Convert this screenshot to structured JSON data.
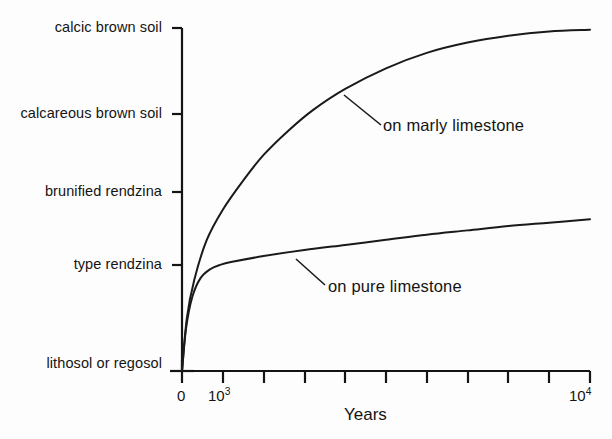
{
  "chart_data": {
    "type": "line",
    "title": "",
    "xlabel": "Years",
    "ylabel": "",
    "grid": false,
    "legend_position": "inline-annotations",
    "xlim": [
      0,
      10000
    ],
    "x_ticks": [
      0,
      1000,
      2000,
      3000,
      4000,
      5000,
      6000,
      7000,
      8000,
      9000,
      10000
    ],
    "x_tick_labels": [
      "0",
      "10^3",
      "",
      "",
      "",
      "",
      "",
      "",
      "",
      "",
      "10^4"
    ],
    "x_tick_label_display": [
      {
        "value": 0,
        "base": "0",
        "exp": ""
      },
      {
        "value": 1000,
        "base": "10",
        "exp": "3"
      },
      {
        "value": 10000,
        "base": "10",
        "exp": "4"
      }
    ],
    "y_categories": [
      "lithosol or regosol",
      "type rendzina",
      "brunified rendzina",
      "calcareous brown soil",
      "calcic brown soil"
    ],
    "y_category_levels": [
      0,
      1,
      2,
      3,
      4
    ],
    "series": [
      {
        "name": "on marly limestone",
        "annotation": "on marly limestone",
        "points": [
          {
            "x": 0,
            "y": 0.0
          },
          {
            "x": 120,
            "y": 0.62
          },
          {
            "x": 300,
            "y": 1.06
          },
          {
            "x": 600,
            "y": 1.52
          },
          {
            "x": 1000,
            "y": 1.88
          },
          {
            "x": 1500,
            "y": 2.22
          },
          {
            "x": 2000,
            "y": 2.52
          },
          {
            "x": 2600,
            "y": 2.8
          },
          {
            "x": 3200,
            "y": 3.04
          },
          {
            "x": 4000,
            "y": 3.29
          },
          {
            "x": 5000,
            "y": 3.53
          },
          {
            "x": 6000,
            "y": 3.71
          },
          {
            "x": 7000,
            "y": 3.83
          },
          {
            "x": 8000,
            "y": 3.91
          },
          {
            "x": 9000,
            "y": 3.96
          },
          {
            "x": 10000,
            "y": 3.98
          }
        ]
      },
      {
        "name": "on pure limestone",
        "annotation": "on pure limestone",
        "points": [
          {
            "x": 0,
            "y": 0.0
          },
          {
            "x": 100,
            "y": 0.5
          },
          {
            "x": 250,
            "y": 0.86
          },
          {
            "x": 450,
            "y": 1.08
          },
          {
            "x": 700,
            "y": 1.19
          },
          {
            "x": 950,
            "y": 1.24
          },
          {
            "x": 1200,
            "y": 1.27
          },
          {
            "x": 2000,
            "y": 1.34
          },
          {
            "x": 3000,
            "y": 1.41
          },
          {
            "x": 4000,
            "y": 1.47
          },
          {
            "x": 5000,
            "y": 1.53
          },
          {
            "x": 6000,
            "y": 1.59
          },
          {
            "x": 7000,
            "y": 1.64
          },
          {
            "x": 8000,
            "y": 1.69
          },
          {
            "x": 9000,
            "y": 1.73
          },
          {
            "x": 10000,
            "y": 1.77
          }
        ]
      }
    ]
  },
  "axis": {
    "x_title": "Years",
    "tick_0": "0",
    "tick_1e3_base": "10",
    "tick_1e3_exp": "3",
    "tick_1e4_base": "10",
    "tick_1e4_exp": "4"
  },
  "y_labels": {
    "l4": "calcic brown soil",
    "l3": "calcareous brown soil",
    "l2": "brunified rendzina",
    "l1": "type rendzina",
    "l0": "lithosol or regosol"
  },
  "annotations": {
    "marly": "on marly limestone",
    "pure": "on pure limestone"
  },
  "colors": {
    "background": "#fdfdfd",
    "ink": "#141414",
    "curve": "#1a1a1a"
  }
}
